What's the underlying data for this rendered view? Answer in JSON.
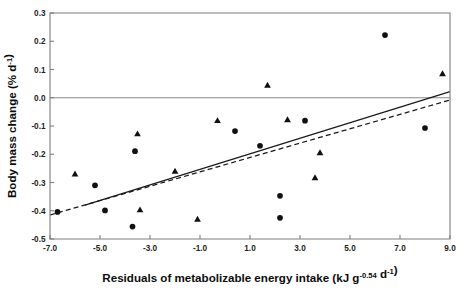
{
  "chart_data": {
    "type": "scatter",
    "title": "",
    "xlabel": "Residuals of metabolizable energy intake (kJ g-0.54 d-1)",
    "xlabel_parts": {
      "main": "Residuals of metabolizable energy intake (kJ g",
      "sup1": "-0.54",
      "mid": " d",
      "sup2": "-1",
      "tail": ")"
    },
    "ylabel": "Body mass change (% d-1)",
    "ylabel_parts": {
      "main": "Body mass change (% d",
      "sup1": "-1",
      "tail": ")"
    },
    "xlim": [
      -7.0,
      9.0
    ],
    "ylim": [
      -0.5,
      0.3
    ],
    "xticks": [
      -7.0,
      -5.0,
      -3.0,
      -1.0,
      1.0,
      3.0,
      5.0,
      7.0,
      9.0
    ],
    "xticklabels": [
      "-7.0",
      "-5.0",
      "-3.0",
      "-1.0",
      "1.0",
      "3.0",
      "5.0",
      "7.0",
      "9.0"
    ],
    "yticks": [
      0.3,
      0.2,
      0.1,
      0.0,
      -0.1,
      -0.2,
      -0.3,
      -0.4,
      -0.5
    ],
    "yticklabels": [
      "0.3",
      "0.2",
      "0.1",
      "0.0",
      "-0.1",
      "-0.2",
      "-0.3",
      "-0.4",
      "-0.5"
    ],
    "grid": false,
    "legend": "none",
    "reference_lines": [
      {
        "name": "zero-reference-line",
        "orientation": "horizontal",
        "y": 0.0,
        "style": "solid",
        "color": "#8a8a8a"
      }
    ],
    "series": [
      {
        "name": "circles",
        "marker": "filled-circle",
        "color": "#101010",
        "points": [
          {
            "x": -6.7,
            "y": -0.404
          },
          {
            "x": -5.2,
            "y": -0.31
          },
          {
            "x": -4.8,
            "y": -0.399
          },
          {
            "x": -3.6,
            "y": -0.189
          },
          {
            "x": -3.7,
            "y": -0.456
          },
          {
            "x": 0.4,
            "y": -0.118
          },
          {
            "x": 1.4,
            "y": -0.17
          },
          {
            "x": 2.2,
            "y": -0.347
          },
          {
            "x": 2.2,
            "y": -0.425
          },
          {
            "x": 3.2,
            "y": -0.081
          },
          {
            "x": 6.4,
            "y": 0.222
          },
          {
            "x": 8.0,
            "y": -0.107
          }
        ]
      },
      {
        "name": "triangles",
        "marker": "filled-triangle",
        "color": "#101010",
        "points": [
          {
            "x": -6.0,
            "y": -0.27
          },
          {
            "x": -3.5,
            "y": -0.128
          },
          {
            "x": -3.4,
            "y": -0.397
          },
          {
            "x": -2.0,
            "y": -0.26
          },
          {
            "x": -1.1,
            "y": -0.43
          },
          {
            "x": -0.3,
            "y": -0.081
          },
          {
            "x": 1.7,
            "y": 0.044
          },
          {
            "x": 2.5,
            "y": -0.078
          },
          {
            "x": 3.8,
            "y": -0.195
          },
          {
            "x": 3.6,
            "y": -0.283
          },
          {
            "x": 8.7,
            "y": 0.085
          }
        ]
      }
    ],
    "trend_lines": [
      {
        "name": "solid-regression-line",
        "style": "solid",
        "x_start": -5.6,
        "y_start": -0.38,
        "x_end": 9.0,
        "y_end": 0.022
      },
      {
        "name": "dashed-regression-line",
        "style": "dashed",
        "x_start": -7.0,
        "y_start": -0.415,
        "x_end": 9.0,
        "y_end": -0.008
      }
    ]
  }
}
